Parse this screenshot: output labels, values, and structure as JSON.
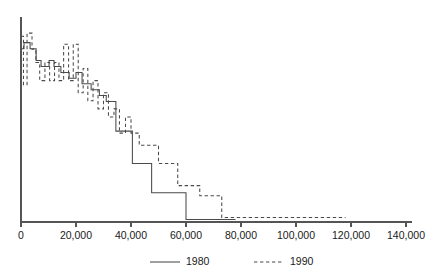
{
  "chart_data": {
    "type": "line",
    "subtype": "step-survival",
    "title": "",
    "subtitle": "",
    "xlabel": "",
    "ylabel": "",
    "xlim": [
      0,
      140000
    ],
    "ylim": [
      0,
      1
    ],
    "grid": false,
    "legend_position": "bottom-center",
    "xticks": [
      0,
      20000,
      40000,
      60000,
      80000,
      100000,
      120000,
      140000
    ],
    "xtick_labels": [
      "0",
      "20,000",
      "40,000",
      "60,000",
      "80,000",
      "100,000",
      "120,000",
      "140,000"
    ],
    "yticks": [],
    "ytick_labels": [],
    "series": [
      {
        "name": "1980",
        "style": "solid",
        "color": "#4a4a4a",
        "points": [
          [
            0,
            0.858
          ],
          [
            1100,
            0.858
          ],
          [
            1100,
            0.888
          ],
          [
            3300,
            0.888
          ],
          [
            3300,
            0.858
          ],
          [
            5500,
            0.858
          ],
          [
            5500,
            0.8
          ],
          [
            7300,
            0.8
          ],
          [
            7300,
            0.77
          ],
          [
            10200,
            0.77
          ],
          [
            10200,
            0.8
          ],
          [
            12000,
            0.8
          ],
          [
            12000,
            0.77
          ],
          [
            14500,
            0.77
          ],
          [
            14500,
            0.74
          ],
          [
            17500,
            0.74
          ],
          [
            17500,
            0.712
          ],
          [
            20000,
            0.712
          ],
          [
            20000,
            0.74
          ],
          [
            22200,
            0.74
          ],
          [
            22200,
            0.684
          ],
          [
            25500,
            0.684
          ],
          [
            25500,
            0.655
          ],
          [
            28500,
            0.655
          ],
          [
            28500,
            0.626
          ],
          [
            31000,
            0.626
          ],
          [
            31000,
            0.597
          ],
          [
            34500,
            0.597
          ],
          [
            34500,
            0.45
          ],
          [
            40500,
            0.45
          ],
          [
            40500,
            0.29
          ],
          [
            47500,
            0.29
          ],
          [
            47500,
            0.145
          ],
          [
            60000,
            0.145
          ],
          [
            60000,
            0.012
          ],
          [
            78000,
            0.012
          ]
        ]
      },
      {
        "name": "1990",
        "style": "dashed",
        "color": "#4a4a4a",
        "points": [
          [
            0,
            0.92
          ],
          [
            900,
            0.92
          ],
          [
            900,
            0.68
          ],
          [
            2200,
            0.68
          ],
          [
            2200,
            0.935
          ],
          [
            4000,
            0.935
          ],
          [
            4000,
            0.855
          ],
          [
            5400,
            0.855
          ],
          [
            5400,
            0.79
          ],
          [
            6800,
            0.79
          ],
          [
            6800,
            0.7
          ],
          [
            8700,
            0.7
          ],
          [
            8700,
            0.79
          ],
          [
            10400,
            0.79
          ],
          [
            10400,
            0.7
          ],
          [
            12200,
            0.7
          ],
          [
            12200,
            0.79
          ],
          [
            13800,
            0.79
          ],
          [
            13800,
            0.7
          ],
          [
            15500,
            0.7
          ],
          [
            15500,
            0.88
          ],
          [
            17300,
            0.88
          ],
          [
            17300,
            0.7
          ],
          [
            19000,
            0.7
          ],
          [
            19000,
            0.88
          ],
          [
            20800,
            0.88
          ],
          [
            20800,
            0.64
          ],
          [
            22600,
            0.64
          ],
          [
            22600,
            0.76
          ],
          [
            24300,
            0.76
          ],
          [
            24300,
            0.6
          ],
          [
            26200,
            0.6
          ],
          [
            26200,
            0.7
          ],
          [
            28000,
            0.7
          ],
          [
            28000,
            0.56
          ],
          [
            30000,
            0.56
          ],
          [
            30000,
            0.64
          ],
          [
            31800,
            0.64
          ],
          [
            31800,
            0.52
          ],
          [
            33800,
            0.52
          ],
          [
            33800,
            0.56
          ],
          [
            35800,
            0.56
          ],
          [
            35800,
            0.44
          ],
          [
            38000,
            0.44
          ],
          [
            38000,
            0.52
          ],
          [
            40000,
            0.52
          ],
          [
            40000,
            0.44
          ],
          [
            43000,
            0.44
          ],
          [
            43000,
            0.38
          ],
          [
            50000,
            0.38
          ],
          [
            50000,
            0.29
          ],
          [
            57000,
            0.29
          ],
          [
            57000,
            0.18
          ],
          [
            65000,
            0.18
          ],
          [
            65000,
            0.13
          ],
          [
            73000,
            0.13
          ],
          [
            73000,
            0.022
          ],
          [
            118000,
            0.022
          ]
        ]
      }
    ],
    "legend": [
      {
        "label": "1980",
        "style": "solid"
      },
      {
        "label": "1990",
        "style": "dashed"
      }
    ]
  }
}
